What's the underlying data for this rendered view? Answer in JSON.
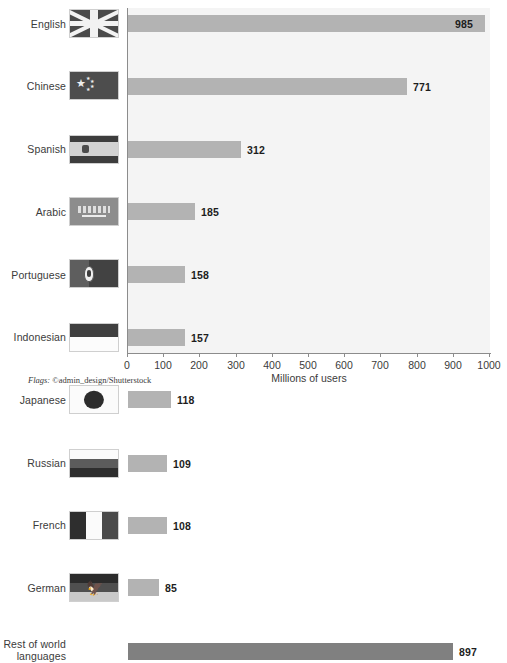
{
  "chart_data": {
    "type": "bar",
    "orientation": "horizontal",
    "title": "",
    "xlabel": "Millions of users",
    "ylabel": "",
    "xlim": [
      0,
      1000
    ],
    "xticks": [
      0,
      100,
      200,
      300,
      400,
      500,
      600,
      700,
      800,
      900,
      1000
    ],
    "grid": false,
    "categories": [
      "English",
      "Chinese",
      "Spanish",
      "Arabic",
      "Portuguese",
      "Indonesian",
      "Japanese",
      "Russian",
      "French",
      "German",
      "Rest of world languages"
    ],
    "values": [
      985,
      771,
      312,
      185,
      158,
      157,
      118,
      109,
      108,
      85,
      897
    ],
    "value_labels": [
      "985",
      "771",
      "312",
      "185",
      "158",
      "157",
      "118",
      "109",
      "108",
      "85",
      "897"
    ],
    "bar_colors": [
      "#b3b3b3",
      "#b3b3b3",
      "#b3b3b3",
      "#b3b3b3",
      "#b3b3b3",
      "#b3b3b3",
      "#b3b3b3",
      "#b3b3b3",
      "#b3b3b3",
      "#b3b3b3",
      "#808080"
    ],
    "flag_icons": [
      "flag-united-kingdom",
      "flag-china",
      "flag-spain",
      "flag-saudi-arabia",
      "flag-portugal",
      "flag-indonesia",
      "flag-japan",
      "flag-russia",
      "flag-france",
      "flag-germany",
      ""
    ],
    "plot_background": "#f4f4f4",
    "axis_color": "#8c8c8c",
    "label_color": "#3b3b3b"
  },
  "credit": {
    "prefix": "Flags:",
    "text": " ©admin_design/Shutterstock"
  }
}
